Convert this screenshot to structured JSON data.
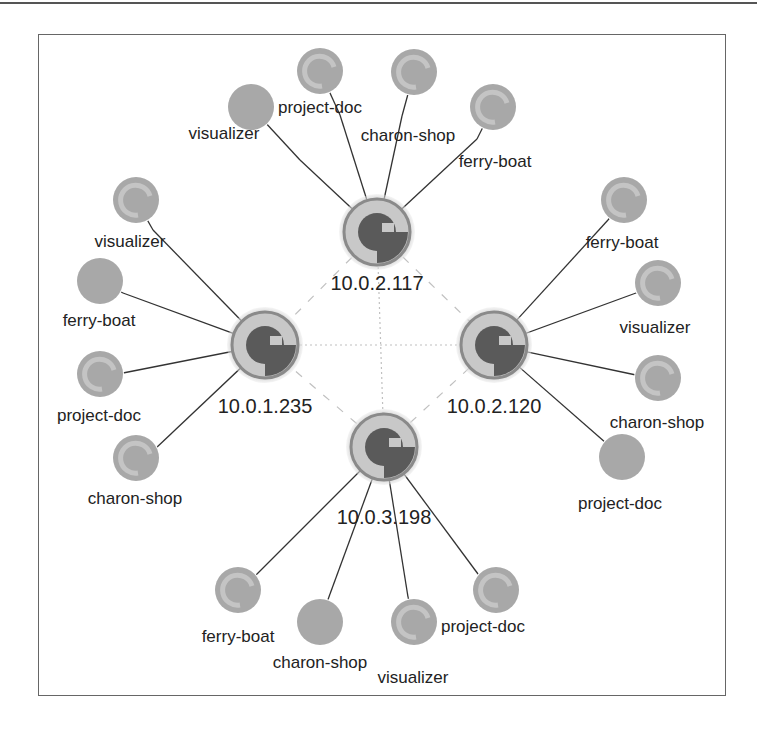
{
  "diagram": {
    "colors": {
      "hub_outer": "#8a8a8a",
      "hub_ring": "#c8c8c8",
      "hub_core": "#5a5a5a",
      "leaf_fill": "#a8a8a8",
      "leaf_ring": "#c4c4c4",
      "edge": "#333333",
      "mesh": "#c0c0c0"
    },
    "hubs": [
      {
        "id": "h117",
        "label": "10.0.2.117",
        "cx": 377,
        "cy": 232,
        "lx": 377,
        "ly": 290
      },
      {
        "id": "h235",
        "label": "10.0.1.235",
        "cx": 265,
        "cy": 345,
        "lx": 265,
        "ly": 413
      },
      {
        "id": "h120",
        "label": "10.0.2.120",
        "cx": 494,
        "cy": 345,
        "lx": 494,
        "ly": 413
      },
      {
        "id": "h198",
        "label": "10.0.3.198",
        "cx": 384,
        "cy": 447,
        "lx": 384,
        "ly": 524
      }
    ],
    "mesh_links": [
      {
        "from": "h235",
        "to": "h120",
        "style": "dotted"
      },
      {
        "from": "h117",
        "to": "h198",
        "style": "dotted"
      },
      {
        "from": "h117",
        "to": "h235",
        "style": "dashed"
      },
      {
        "from": "h117",
        "to": "h120",
        "style": "dashed"
      },
      {
        "from": "h198",
        "to": "h235",
        "style": "dashed"
      },
      {
        "from": "h198",
        "to": "h120",
        "style": "dashed"
      }
    ],
    "leaves": [
      {
        "hub": "h117",
        "label": "visualizer",
        "cx": 251,
        "cy": 107,
        "lx": 224,
        "ly": 139,
        "solid": true,
        "ex": 300,
        "ey": 160
      },
      {
        "hub": "h117",
        "label": "project-doc",
        "cx": 320,
        "cy": 71,
        "lx": 320,
        "ly": 113,
        "solid": false,
        "ex": 340,
        "ey": 115
      },
      {
        "hub": "h117",
        "label": "charon-shop",
        "cx": 414,
        "cy": 72,
        "lx": 408,
        "ly": 141,
        "solid": false,
        "ex": 402,
        "ey": 116
      },
      {
        "hub": "h117",
        "label": "ferry-boat",
        "cx": 493,
        "cy": 107,
        "lx": 495,
        "ly": 167,
        "solid": false,
        "ex": 477,
        "ey": 139
      },
      {
        "hub": "h235",
        "label": "visualizer",
        "cx": 136,
        "cy": 200,
        "lx": 130,
        "ly": 247,
        "solid": false,
        "ex": 153,
        "ey": 230
      },
      {
        "hub": "h235",
        "label": "ferry-boat",
        "cx": 100,
        "cy": 281,
        "lx": 99,
        "ly": 326,
        "solid": true,
        "ex": 123,
        "ey": 293
      },
      {
        "hub": "h235",
        "label": "project-doc",
        "cx": 100,
        "cy": 374,
        "lx": 99,
        "ly": 421,
        "solid": false,
        "ex": 123,
        "ey": 373
      },
      {
        "hub": "h235",
        "label": "charon-shop",
        "cx": 136,
        "cy": 458,
        "lx": 135,
        "ly": 504,
        "solid": false,
        "ex": 155,
        "ey": 449
      },
      {
        "hub": "h120",
        "label": "ferry-boat",
        "cx": 624,
        "cy": 200,
        "lx": 622,
        "ly": 248,
        "solid": false,
        "ex": 608,
        "ey": 220
      },
      {
        "hub": "h120",
        "label": "visualizer",
        "cx": 658,
        "cy": 283,
        "lx": 655,
        "ly": 333,
        "solid": false,
        "ex": 636,
        "ey": 293
      },
      {
        "hub": "h120",
        "label": "charon-shop",
        "cx": 658,
        "cy": 378,
        "lx": 657,
        "ly": 428,
        "solid": false,
        "ex": 636,
        "ey": 375
      },
      {
        "hub": "h120",
        "label": "project-doc",
        "cx": 622,
        "cy": 457,
        "lx": 620,
        "ly": 509,
        "solid": true,
        "ex": 606,
        "ey": 443
      },
      {
        "hub": "h198",
        "label": "ferry-boat",
        "cx": 238,
        "cy": 590,
        "lx": 238,
        "ly": 642,
        "solid": false,
        "ex": 257,
        "ey": 574
      },
      {
        "hub": "h198",
        "label": "charon-shop",
        "cx": 320,
        "cy": 622,
        "lx": 320,
        "ly": 668,
        "solid": true,
        "ex": 330,
        "ey": 594
      },
      {
        "hub": "h198",
        "label": "visualizer",
        "cx": 414,
        "cy": 622,
        "lx": 413,
        "ly": 683,
        "solid": false,
        "ex": 408,
        "ey": 597
      },
      {
        "hub": "h198",
        "label": "project-doc",
        "cx": 496,
        "cy": 590,
        "lx": 483,
        "ly": 632,
        "solid": false,
        "ex": 478,
        "ey": 574
      }
    ]
  }
}
